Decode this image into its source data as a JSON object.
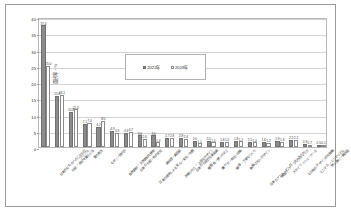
{
  "chart_data": {
    "type": "bar",
    "title": "",
    "xlabel": "",
    "ylabel": "選択率・%",
    "ylim": [
      0,
      40
    ],
    "ytick_labels": [
      "0",
      "5",
      "10",
      "15",
      "20",
      "25",
      "30",
      "35",
      "40"
    ],
    "ytick_values": [
      0,
      5,
      10,
      15,
      20,
      25,
      30,
      35,
      40
    ],
    "grid": true,
    "legend_position": "upper-center-inset",
    "categories": [
      "日本的なものへのこだわり",
      "伝統・格式を重んじる",
      "シンプル",
      "落ち着き",
      "モダン・現代的",
      "自然素材・天然素材を使用",
      "日本の伝統・和の文化",
      "日本の技術による安心・安全・信頼",
      "高級感・高品質",
      "洗練された・上品なデザイン",
      "日本の伝統的な美意識",
      "機能性・使いやすさ",
      "華やか・明るい印象",
      "繊細・丁寧なつくり",
      "無駄のないデザイン",
      "日本のアニメ・マンガ・キャラクター",
      "個性的・アーティスティック",
      "スタイリッシュ・クール",
      "その他のデザイン的な特徴",
      "ミニマル・ミニマリズム",
      "特に無い・無回答"
    ],
    "series": [
      {
        "name": "2022年",
        "values": [
          37.4,
          15.8,
          10.8,
          7.1,
          6.2,
          4.9,
          4.4,
          3.6,
          3.6,
          2.7,
          2.8,
          2.0,
          2.0,
          1.6,
          1.8,
          1.5,
          1.6,
          1.9,
          2.2,
          0.9,
          0.5
        ],
        "labels": [
          "37.4",
          "15.8",
          "10.8",
          "7.1",
          "6.2",
          "4.9",
          "4.4",
          "3.6",
          "3.6",
          "2.7",
          "2.8",
          "2.0",
          "2.0",
          "1.6",
          "1.8",
          "1.5",
          "1.6",
          "1.9",
          "2.2",
          "0.9",
          "0.5"
        ]
      },
      {
        "name": "2019年",
        "values": [
          25.0,
          16.1,
          11.6,
          7.4,
          8.0,
          4.3,
          4.7,
          2.6,
          1.4,
          2.8,
          2.4,
          1.1,
          1.4,
          1.5,
          1.7,
          1.4,
          1.2,
          1.6,
          2.2,
          0.7,
          0.1
        ],
        "labels": [
          "25.0",
          "16.1",
          "11.6",
          "7.4",
          "8.0",
          "4.3",
          "4.7",
          "2.6",
          "1.4",
          "2.8",
          "2.4",
          "1.1",
          "1.4",
          "1.5",
          "1.7",
          "1.4",
          "1.2",
          "1.6",
          "2.2",
          "0.7",
          "0.1"
        ]
      }
    ],
    "colors": {
      "series_2022": "#8c8c8c",
      "series_2019": "#ffffff",
      "grid": "#d2d2d2",
      "frame": "#b8b8b8",
      "text": "#2a2a2a"
    }
  },
  "legend": {
    "entries": [
      {
        "label": "2022年"
      },
      {
        "label": "2019年"
      }
    ]
  }
}
